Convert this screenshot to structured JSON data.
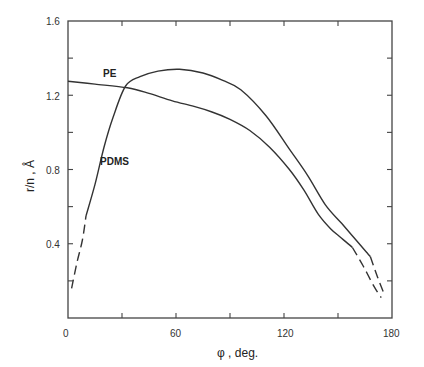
{
  "chart_data": {
    "type": "line",
    "title": "",
    "xlabel": "φ , deg.",
    "ylabel": "r/n , Å",
    "xlim": [
      0,
      180
    ],
    "ylim": [
      0,
      1.6
    ],
    "xticks": [
      0,
      60,
      120,
      180
    ],
    "xticks_minor": [
      30,
      90,
      150
    ],
    "yticks": [
      0.4,
      0.8,
      1.2,
      1.6
    ],
    "yticks_minor": [
      0.2,
      0.6,
      1.0,
      1.4
    ],
    "grid": false,
    "legend": "inline labels",
    "series": [
      {
        "name": "PE",
        "label_position": {
          "x": 30,
          "y": 1.3
        },
        "solid": [
          [
            0,
            1.275
          ],
          [
            15,
            1.26
          ],
          [
            33,
            1.24
          ],
          [
            45,
            1.21
          ],
          [
            58,
            1.17
          ],
          [
            70,
            1.14
          ],
          [
            80,
            1.11
          ],
          [
            90,
            1.07
          ],
          [
            101,
            1.01
          ],
          [
            112,
            0.92
          ],
          [
            123,
            0.8
          ],
          [
            131,
            0.69
          ],
          [
            139,
            0.56
          ],
          [
            146,
            0.48
          ],
          [
            152,
            0.43
          ],
          [
            158,
            0.38
          ]
        ],
        "dashed": [
          [
            158,
            0.38
          ],
          [
            164,
            0.28
          ],
          [
            170,
            0.17
          ],
          [
            174,
            0.11
          ]
        ]
      },
      {
        "name": "PDMS",
        "label_position": {
          "x": 22,
          "y": 0.8
        },
        "dashed": [
          [
            2,
            0.16
          ],
          [
            5,
            0.3
          ],
          [
            8,
            0.42
          ],
          [
            10,
            0.55
          ]
        ],
        "solid": [
          [
            10,
            0.55
          ],
          [
            15,
            0.72
          ],
          [
            20,
            0.92
          ],
          [
            25,
            1.08
          ],
          [
            32,
            1.25
          ],
          [
            40,
            1.3
          ],
          [
            50,
            1.33
          ],
          [
            62,
            1.34
          ],
          [
            75,
            1.32
          ],
          [
            86,
            1.28
          ],
          [
            96,
            1.23
          ],
          [
            110,
            1.09
          ],
          [
            123,
            0.91
          ],
          [
            133,
            0.77
          ],
          [
            143,
            0.61
          ],
          [
            152,
            0.51
          ],
          [
            160,
            0.42
          ],
          [
            168,
            0.33
          ]
        ],
        "dashed_end": [
          [
            168,
            0.33
          ],
          [
            172,
            0.22
          ],
          [
            176,
            0.12
          ]
        ]
      }
    ]
  },
  "axes": {
    "x_tick_labels": [
      "0",
      "60",
      "120",
      "180"
    ],
    "y_tick_labels": [
      "0.4",
      "0.8",
      "1.2",
      "1.6"
    ],
    "x_title": "φ , deg.",
    "y_title": "r/n , Å"
  },
  "labels": {
    "pe": "PE",
    "pdms": "PDMS"
  },
  "colors": {
    "line": "#333333",
    "axis": "#444444",
    "background": "#ffffff"
  }
}
